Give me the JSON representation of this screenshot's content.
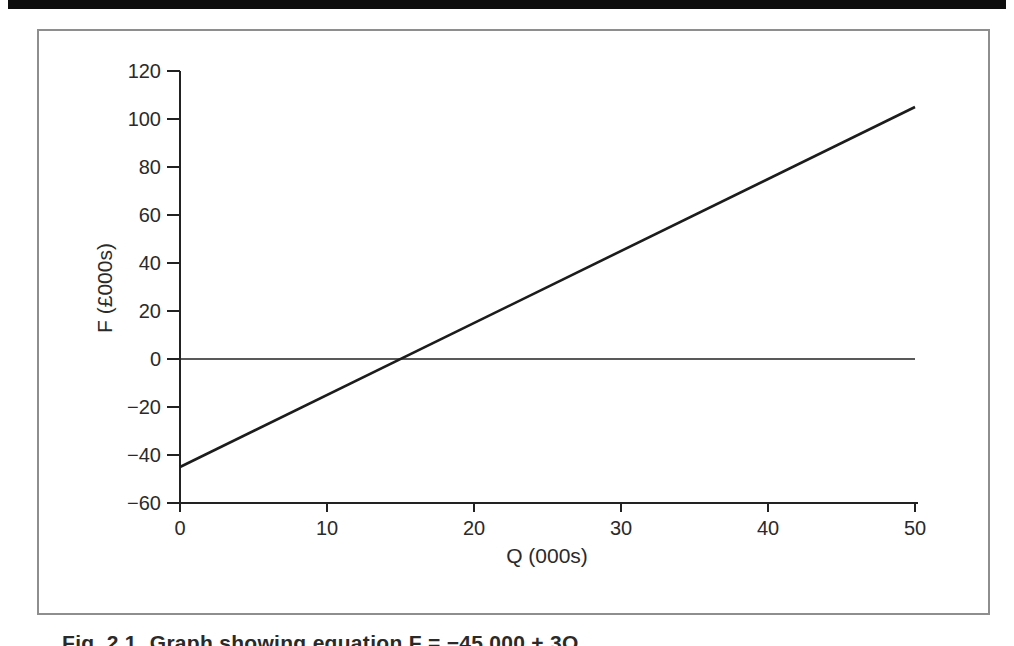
{
  "scan": {
    "top_bar_color": "#0e0e0e"
  },
  "figure": {
    "caption_label": "Fig. 2.1",
    "caption_text": "Graph showing equation F = −45,000 + 3Q",
    "border_color": "#8e8e8e"
  },
  "chart_data": {
    "type": "line",
    "title": "",
    "xlabel": "Q (000s)",
    "ylabel": "F (£000s)",
    "xlim": [
      0,
      50
    ],
    "ylim": [
      -60,
      120
    ],
    "x_ticks": [
      0,
      10,
      20,
      30,
      40,
      50
    ],
    "y_ticks": [
      120,
      100,
      80,
      60,
      40,
      20,
      0,
      -20,
      -40,
      -60
    ],
    "grid": false,
    "legend_position": "none",
    "zero_line_y": 0,
    "axis_color": "#222222",
    "tick_label_color": "#2a2a2a",
    "line_color": "#1c1c1c",
    "series": [
      {
        "name": "F = −45,000 + 3Q",
        "x": [
          0,
          50
        ],
        "values": [
          -45,
          105
        ]
      }
    ]
  }
}
